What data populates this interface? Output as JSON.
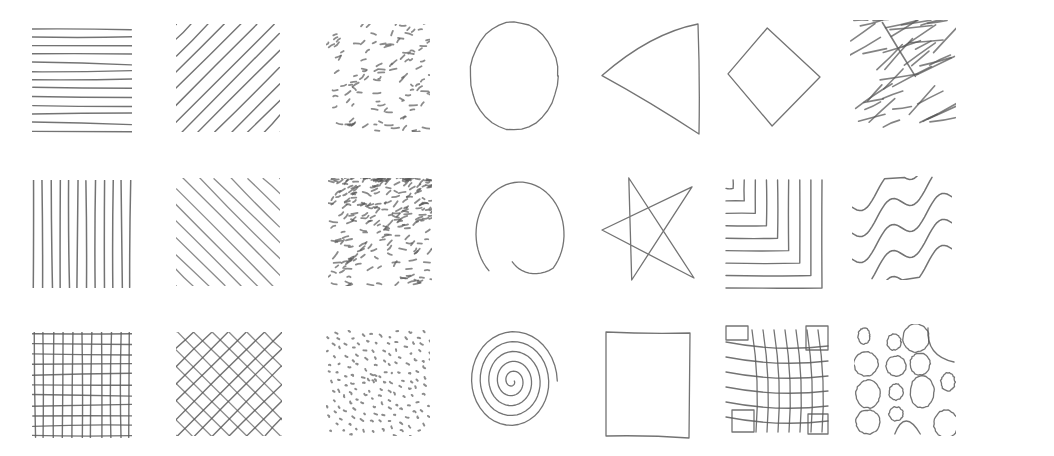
{
  "sheet": {
    "title": "",
    "background": "#ffffff",
    "pencil_color": "#5a5a5a",
    "rows": 3,
    "cols": 7
  },
  "patterns": [
    {
      "id": "horizontal-lines",
      "row": 0,
      "col": 0,
      "x": 32,
      "y": 27,
      "w": 100,
      "h": 106,
      "kind": "hlines",
      "count": 13
    },
    {
      "id": "diagonal-lines-up",
      "row": 0,
      "col": 1,
      "x": 176,
      "y": 24,
      "w": 104,
      "h": 108,
      "kind": "diag_up",
      "count": 14
    },
    {
      "id": "scattered-dashes",
      "row": 0,
      "col": 2,
      "x": 326,
      "y": 24,
      "w": 104,
      "h": 108,
      "kind": "dashes",
      "density": "uniform"
    },
    {
      "id": "circle",
      "row": 0,
      "col": 3,
      "x": 468,
      "y": 20,
      "w": 92,
      "h": 112,
      "kind": "circle"
    },
    {
      "id": "triangle",
      "row": 0,
      "col": 4,
      "x": 600,
      "y": 22,
      "w": 100,
      "h": 114,
      "kind": "triangle"
    },
    {
      "id": "diamond",
      "row": 0,
      "col": 5,
      "x": 726,
      "y": 26,
      "w": 96,
      "h": 102,
      "kind": "diamond"
    },
    {
      "id": "messy-hatching",
      "row": 0,
      "col": 6,
      "x": 850,
      "y": 20,
      "w": 106,
      "h": 114,
      "kind": "messy"
    },
    {
      "id": "vertical-lines",
      "row": 1,
      "col": 0,
      "x": 32,
      "y": 180,
      "w": 100,
      "h": 108,
      "kind": "vlines",
      "count": 12
    },
    {
      "id": "diagonal-lines-down",
      "row": 1,
      "col": 1,
      "x": 176,
      "y": 178,
      "w": 104,
      "h": 108,
      "kind": "diag_down",
      "count": 14
    },
    {
      "id": "gradient-dashes",
      "row": 1,
      "col": 2,
      "x": 328,
      "y": 178,
      "w": 104,
      "h": 108,
      "kind": "dashes",
      "density": "gradient"
    },
    {
      "id": "spiral-open",
      "row": 1,
      "col": 3,
      "x": 474,
      "y": 178,
      "w": 92,
      "h": 112,
      "kind": "open_circle"
    },
    {
      "id": "star",
      "row": 1,
      "col": 4,
      "x": 600,
      "y": 176,
      "w": 96,
      "h": 108,
      "kind": "star"
    },
    {
      "id": "nested-corners",
      "row": 1,
      "col": 5,
      "x": 724,
      "y": 178,
      "w": 100,
      "h": 112,
      "kind": "corners",
      "count": 9
    },
    {
      "id": "wavy-lines",
      "row": 1,
      "col": 6,
      "x": 852,
      "y": 176,
      "w": 100,
      "h": 104,
      "kind": "waves",
      "count": 5
    },
    {
      "id": "grid",
      "row": 2,
      "col": 0,
      "x": 32,
      "y": 332,
      "w": 100,
      "h": 106,
      "kind": "grid",
      "count": 11
    },
    {
      "id": "crosshatch",
      "row": 2,
      "col": 1,
      "x": 176,
      "y": 332,
      "w": 106,
      "h": 104,
      "kind": "crosshatch",
      "count": 13
    },
    {
      "id": "radial-dots",
      "row": 2,
      "col": 2,
      "x": 326,
      "y": 330,
      "w": 104,
      "h": 106,
      "kind": "radial_dots"
    },
    {
      "id": "spiral",
      "row": 2,
      "col": 3,
      "x": 470,
      "y": 326,
      "w": 94,
      "h": 110,
      "kind": "spiral",
      "turns": 5
    },
    {
      "id": "square",
      "row": 2,
      "col": 4,
      "x": 604,
      "y": 330,
      "w": 88,
      "h": 110,
      "kind": "square"
    },
    {
      "id": "distorted-grid",
      "row": 2,
      "col": 5,
      "x": 724,
      "y": 324,
      "w": 106,
      "h": 114,
      "kind": "distorted_grid"
    },
    {
      "id": "bubbles",
      "row": 2,
      "col": 6,
      "x": 854,
      "y": 324,
      "w": 102,
      "h": 112,
      "kind": "bubbles"
    }
  ]
}
